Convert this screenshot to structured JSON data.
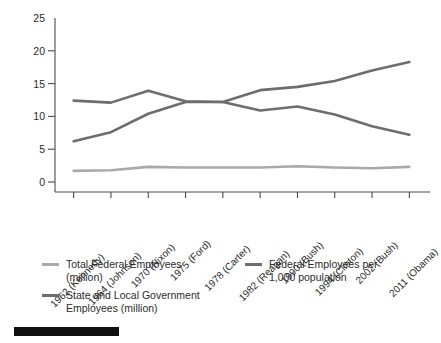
{
  "chart_data": {
    "type": "line",
    "title": "",
    "xlabel": "",
    "ylabel": "",
    "ylim": [
      0,
      25
    ],
    "yticks": [
      0,
      5,
      10,
      15,
      20,
      25
    ],
    "grid": false,
    "legend_position": "bottom",
    "categories": [
      "1962 (Kennedy)",
      "1964 (Johnson)",
      "1970 (Nixon)",
      "1975 (Ford)",
      "1978 (Carter)",
      "1982 (Reagan)",
      "1990 (Bush)",
      "1994 (Clinton)",
      "2002 (Bush)",
      "2011 (Obama)"
    ],
    "series": [
      {
        "name": "Total Federal Employees (million)",
        "color": "#a9a9a9",
        "values": [
          1.7,
          1.8,
          2.3,
          2.2,
          2.2,
          2.2,
          2.4,
          2.2,
          2.1,
          2.3
        ]
      },
      {
        "name": "State and Local Government Employees (million)",
        "color": "#6d6d6d",
        "values": [
          6.2,
          7.6,
          10.4,
          12.2,
          12.2,
          14.0,
          14.5,
          15.4,
          17.0,
          18.3
        ]
      },
      {
        "name": "Federal Employees per 1,000 population",
        "color": "#6d6d6d",
        "values": [
          12.4,
          12.1,
          13.9,
          12.3,
          12.2,
          10.9,
          11.5,
          10.3,
          8.5,
          7.2
        ]
      }
    ]
  },
  "legend": {
    "entries": [
      {
        "label": "Total Federal Employees\n(million)",
        "color": "#a9a9a9",
        "column": "left"
      },
      {
        "label": "State and Local Government\nEmployees (million)",
        "color": "#6d6d6d",
        "column": "left"
      },
      {
        "label": "Federal Employees per\n1,000 population",
        "color": "#6d6d6d",
        "column": "right"
      }
    ]
  },
  "footer": {
    "bar_color": "#101010"
  },
  "axis": {
    "line_color": "#4a4a4a",
    "tick_color": "#4a4a4a"
  }
}
